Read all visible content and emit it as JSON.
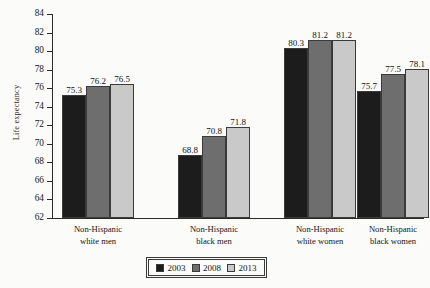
{
  "chart_data": {
    "type": "bar",
    "title": "",
    "xlabel": "",
    "ylabel": "Life expectancy",
    "ylim": [
      62,
      84
    ],
    "ytick_step": 2,
    "yticks": [
      84,
      82,
      80,
      78,
      76,
      74,
      72,
      70,
      68,
      66,
      64,
      62
    ],
    "grid": false,
    "legend_position": "bottom-center",
    "categories": [
      "Non-Hispanic white men",
      "Non-Hispanic black men",
      "Non-Hispanic white women",
      "Non-Hispanic black women"
    ],
    "category_lines": [
      [
        "Non-Hispanic",
        "white men"
      ],
      [
        "Non-Hispanic",
        "black men"
      ],
      [
        "Non-Hispanic",
        "white women"
      ],
      [
        "Non-Hispanic",
        "black women"
      ]
    ],
    "series": [
      {
        "name": "2003",
        "color": "#1c1c1c",
        "values": [
          75.3,
          68.8,
          80.3,
          75.7
        ]
      },
      {
        "name": "2008",
        "color": "#6e6e6e",
        "values": [
          76.2,
          70.8,
          81.2,
          77.5
        ]
      },
      {
        "name": "2013",
        "color": "#c9c9c9",
        "values": [
          76.5,
          71.8,
          81.2,
          78.1
        ]
      }
    ],
    "data_labels": [
      [
        "75.3",
        "76.2",
        "76.5"
      ],
      [
        "68.8",
        "70.8",
        "71.8"
      ],
      [
        "80.3",
        "81.2",
        "81.2"
      ],
      [
        "75.7",
        "77.5",
        "78.1"
      ]
    ]
  },
  "legend": {
    "items": [
      {
        "label": "2003",
        "color": "#1c1c1c"
      },
      {
        "label": "2008",
        "color": "#6e6e6e"
      },
      {
        "label": "2013",
        "color": "#c9c9c9"
      }
    ]
  },
  "axis": {
    "y_title": "Life expectancy"
  }
}
